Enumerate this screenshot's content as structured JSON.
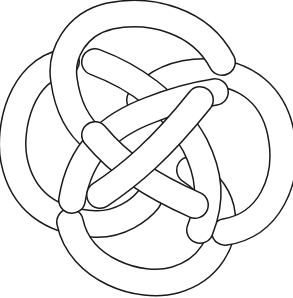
{
  "image": {
    "subject": "Celtic knot line drawing",
    "colors": {
      "background": "#ffffff",
      "line": "#1a1a1a",
      "band_fill": "#ffffff"
    },
    "elements": [
      {
        "name": "top-loop",
        "description": "arc loop at top"
      },
      {
        "name": "right-loop",
        "description": "arc loop at right"
      },
      {
        "name": "bottom-loop",
        "description": "arc loop at bottom"
      },
      {
        "name": "left-loop",
        "description": "arc loop at left"
      },
      {
        "name": "diagonal-band-a",
        "description": "band from upper-left to lower-right"
      },
      {
        "name": "diagonal-band-b",
        "description": "band from lower-left to upper-right"
      }
    ]
  }
}
